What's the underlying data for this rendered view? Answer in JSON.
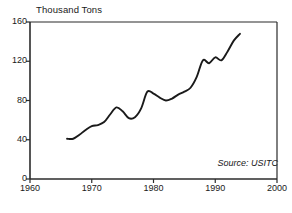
{
  "chart_data": {
    "type": "line",
    "title": "",
    "subtitle": "",
    "ylabel": "Thousand Tons",
    "xlabel": "",
    "xlim": [
      1960,
      2000
    ],
    "ylim": [
      0,
      160
    ],
    "ytick_values": [
      0,
      40,
      80,
      120,
      160
    ],
    "ytick_labels": [
      "0",
      "40",
      "80",
      "120",
      "160"
    ],
    "xtick_values": [
      1960,
      1970,
      1980,
      1990,
      2000
    ],
    "xtick_labels": [
      "1960",
      "1970",
      "1980",
      "1990",
      "2000"
    ],
    "grid": false,
    "legend": false,
    "annotations": [
      {
        "text": "Source:  USITC",
        "position": "bottom-right",
        "style": "italic"
      }
    ],
    "series": [
      {
        "name": "Thousand Tons",
        "color": "#1a1a1a",
        "x": [
          1966,
          1967,
          1968,
          1969,
          1970,
          1971,
          1972,
          1973,
          1974,
          1975,
          1976,
          1977,
          1978,
          1979,
          1980,
          1981,
          1982,
          1983,
          1984,
          1985,
          1986,
          1987,
          1988,
          1989,
          1990,
          1991,
          1992,
          1993,
          1994
        ],
        "values": [
          41,
          41,
          45,
          50,
          54,
          55,
          58,
          66,
          73,
          69,
          62,
          63,
          72,
          89,
          87,
          83,
          80,
          82,
          86,
          89,
          93,
          104,
          121,
          118,
          124,
          121,
          130,
          141,
          148
        ]
      }
    ]
  },
  "labels": {
    "axis_title": "Thousand Tons",
    "source": "Source:  USITC"
  }
}
